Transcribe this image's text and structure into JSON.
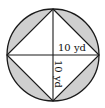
{
  "figure": {
    "labels": {
      "horizontal_radius": "10 yd",
      "vertical_radius": "10 yd"
    },
    "colors": {
      "shade": "#cfcfcf",
      "stroke": "#1a1a1a",
      "background": "#ffffff"
    }
  }
}
